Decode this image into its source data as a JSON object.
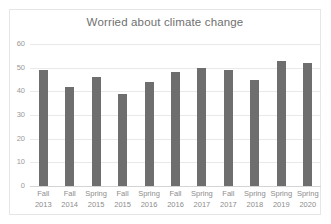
{
  "chart_data": {
    "type": "bar",
    "title": "Worried about climate change",
    "xlabel": "",
    "ylabel": "",
    "ylim": [
      0,
      60
    ],
    "yticks": [
      60,
      50,
      40,
      30,
      20,
      10,
      0
    ],
    "grid": true,
    "legend": "none",
    "bar_color": "#6e6e6e",
    "categories": [
      "Fall 2013",
      "Fall 2014",
      "Spring 2015",
      "Fall 2015",
      "Spring 2016",
      "Fall 2016",
      "Spring 2017",
      "Fall 2017",
      "Spring 2018",
      "Spring 2019",
      "Spring 2020"
    ],
    "category_lines": [
      {
        "season": "Fall",
        "year": "2013"
      },
      {
        "season": "Fall",
        "year": "2014"
      },
      {
        "season": "Spring",
        "year": "2015"
      },
      {
        "season": "Fall",
        "year": "2015"
      },
      {
        "season": "Spring",
        "year": "2016"
      },
      {
        "season": "Fall",
        "year": "2016"
      },
      {
        "season": "Spring",
        "year": "2017"
      },
      {
        "season": "Fall",
        "year": "2017"
      },
      {
        "season": "Spring",
        "year": "2018"
      },
      {
        "season": "Spring",
        "year": "2019"
      },
      {
        "season": "Spring",
        "year": "2020"
      }
    ],
    "values": [
      49,
      42,
      46,
      39,
      44,
      48,
      50,
      49,
      45,
      53,
      52
    ]
  }
}
